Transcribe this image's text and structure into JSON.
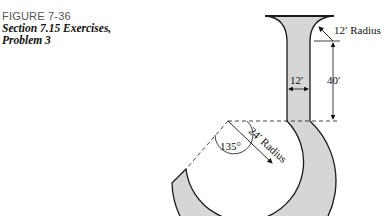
{
  "caption": {
    "figure_number": "FIGURE 7-36",
    "title_line1": "Section 7.15 Exercises,",
    "title_line2": "Problem 3"
  },
  "diagram": {
    "labels": {
      "top_radius": "12′ Radius",
      "width": "12′",
      "height": "40′",
      "curve_radius": "24′ Radius",
      "angle": "135°"
    },
    "colors": {
      "fill": "#d6d6d6",
      "stroke": "#1a1a1a"
    }
  }
}
